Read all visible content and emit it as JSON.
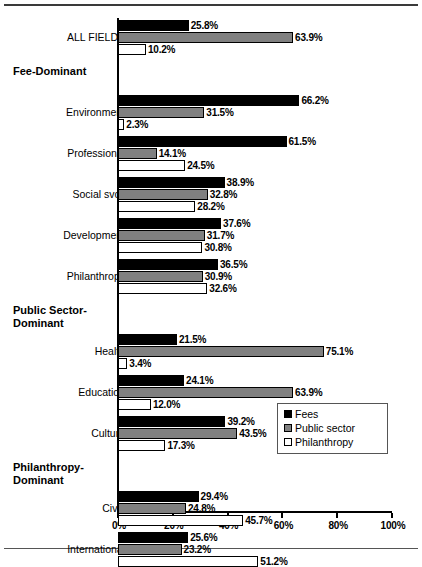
{
  "chart_data": {
    "type": "bar",
    "orientation": "horizontal",
    "title": "",
    "xlabel": "",
    "ylabel": "",
    "xlim": [
      0,
      100
    ],
    "xticks": [
      "0%",
      "20%",
      "40%",
      "60%",
      "80%",
      "100%"
    ],
    "xtick_values": [
      0,
      20,
      40,
      60,
      80,
      100
    ],
    "grid": false,
    "legend_position": "center-right",
    "series": [
      {
        "name": "Fees",
        "color": "#000000"
      },
      {
        "name": "Public sector",
        "color": "#808080"
      },
      {
        "name": "Philanthropy",
        "color": "#FFFFFF"
      }
    ],
    "categories": [
      "ALL FIELDS",
      "Environment",
      "Professional",
      "Social svcs",
      "Development",
      "Philanthropy",
      "Health",
      "Education",
      "Culture",
      "Civic",
      "International"
    ],
    "values": {
      "Fees": [
        25.8,
        66.2,
        61.5,
        38.9,
        37.6,
        36.5,
        21.5,
        24.1,
        39.2,
        29.4,
        25.6
      ],
      "Public sector": [
        63.9,
        31.5,
        14.1,
        32.8,
        31.7,
        30.9,
        75.1,
        63.9,
        43.5,
        24.8,
        23.2
      ],
      "Philanthropy": [
        10.2,
        2.3,
        24.5,
        28.2,
        30.8,
        32.6,
        3.4,
        12.0,
        17.3,
        45.7,
        51.2
      ]
    },
    "section_headers": [
      "Fee-Dominant",
      "Public Sector-Dominant",
      "Philanthropy-Dominant"
    ]
  },
  "legend": {
    "items": [
      {
        "label": "Fees"
      },
      {
        "label": "Public sector"
      },
      {
        "label": "Philanthropy"
      }
    ]
  },
  "axis": {
    "ticks": [
      {
        "label": "0%"
      },
      {
        "label": "20%"
      },
      {
        "label": "40%"
      },
      {
        "label": "60%"
      },
      {
        "label": "80%"
      },
      {
        "label": "100%"
      }
    ]
  },
  "groups": [
    {
      "category": "ALL FIELDS",
      "bars": [
        {
          "series": "Fees",
          "value": 25.8,
          "label": "25.8%"
        },
        {
          "series": "Public sector",
          "value": 63.9,
          "label": "63.9%"
        },
        {
          "series": "Philanthropy",
          "value": 10.2,
          "label": "10.2%"
        }
      ]
    },
    {
      "header": "Fee-Dominant"
    },
    {
      "category": "Environment",
      "bars": [
        {
          "series": "Fees",
          "value": 66.2,
          "label": "66.2%"
        },
        {
          "series": "Public sector",
          "value": 31.5,
          "label": "31.5%"
        },
        {
          "series": "Philanthropy",
          "value": 2.3,
          "label": "2.3%"
        }
      ]
    },
    {
      "category": "Professional",
      "bars": [
        {
          "series": "Fees",
          "value": 61.5,
          "label": "61.5%"
        },
        {
          "series": "Public sector",
          "value": 14.1,
          "label": "14.1%"
        },
        {
          "series": "Philanthropy",
          "value": 24.5,
          "label": "24.5%"
        }
      ]
    },
    {
      "category": "Social svcs",
      "bars": [
        {
          "series": "Fees",
          "value": 38.9,
          "label": "38.9%"
        },
        {
          "series": "Public sector",
          "value": 32.8,
          "label": "32.8%"
        },
        {
          "series": "Philanthropy",
          "value": 28.2,
          "label": "28.2%"
        }
      ]
    },
    {
      "category": "Development",
      "bars": [
        {
          "series": "Fees",
          "value": 37.6,
          "label": "37.6%"
        },
        {
          "series": "Public sector",
          "value": 31.7,
          "label": "31.7%"
        },
        {
          "series": "Philanthropy",
          "value": 30.8,
          "label": "30.8%"
        }
      ]
    },
    {
      "category": "Philanthropy",
      "bars": [
        {
          "series": "Fees",
          "value": 36.5,
          "label": "36.5%"
        },
        {
          "series": "Public sector",
          "value": 30.9,
          "label": "30.9%"
        },
        {
          "series": "Philanthropy",
          "value": 32.6,
          "label": "32.6%"
        }
      ]
    },
    {
      "header": "Public Sector-\nDominant"
    },
    {
      "category": "Health",
      "bars": [
        {
          "series": "Fees",
          "value": 21.5,
          "label": "21.5%"
        },
        {
          "series": "Public sector",
          "value": 75.1,
          "label": "75.1%"
        },
        {
          "series": "Philanthropy",
          "value": 3.4,
          "label": "3.4%"
        }
      ]
    },
    {
      "category": "Education",
      "bars": [
        {
          "series": "Fees",
          "value": 24.1,
          "label": "24.1%"
        },
        {
          "series": "Public sector",
          "value": 63.9,
          "label": "63.9%"
        },
        {
          "series": "Philanthropy",
          "value": 12.0,
          "label": "12.0%"
        }
      ]
    },
    {
      "category": "Culture",
      "bars": [
        {
          "series": "Fees",
          "value": 39.2,
          "label": "39.2%"
        },
        {
          "series": "Public sector",
          "value": 43.5,
          "label": "43.5%"
        },
        {
          "series": "Philanthropy",
          "value": 17.3,
          "label": "17.3%"
        }
      ]
    },
    {
      "header": "Philanthropy-\nDominant"
    },
    {
      "category": "Civic",
      "bars": [
        {
          "series": "Fees",
          "value": 29.4,
          "label": "29.4%"
        },
        {
          "series": "Public sector",
          "value": 24.8,
          "label": "24.8%"
        },
        {
          "series": "Philanthropy",
          "value": 45.7,
          "label": "45.7%"
        }
      ]
    },
    {
      "category": "International",
      "bars": [
        {
          "series": "Fees",
          "value": 25.6,
          "label": "25.6%"
        },
        {
          "series": "Public sector",
          "value": 23.2,
          "label": "23.2%"
        },
        {
          "series": "Philanthropy",
          "value": 51.2,
          "label": "51.2%"
        }
      ]
    }
  ]
}
